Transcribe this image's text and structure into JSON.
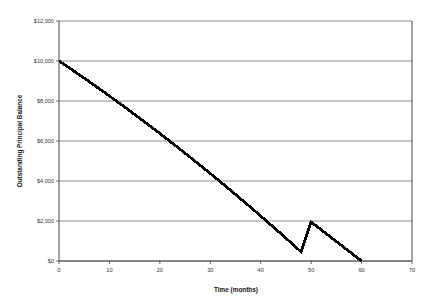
{
  "chart_data": {
    "type": "line",
    "title": "",
    "xlabel": "Time (months)",
    "ylabel": "Outstanding Principal Balance",
    "xlim": [
      0,
      70
    ],
    "ylim": [
      0,
      12000
    ],
    "grid": "horizontal",
    "legend": "none",
    "series": [
      {
        "name": "Outstanding Principal Balance",
        "color": "#000000",
        "x": [
          0,
          2,
          4,
          6,
          8,
          10,
          12,
          14,
          16,
          18,
          20,
          22,
          24,
          26,
          28,
          30,
          32,
          34,
          36,
          38,
          40,
          42,
          44,
          46,
          48,
          50,
          52,
          54,
          56,
          58,
          60
        ],
        "values": [
          10000,
          9660,
          9315,
          8965,
          8610,
          8250,
          7885,
          7515,
          7140,
          6760,
          6375,
          5985,
          5590,
          5190,
          4785,
          4375,
          3960,
          3540,
          3115,
          2685,
          2250,
          1810,
          1365,
          915,
          460,
          1950,
          1560,
          1170,
          780,
          390,
          0
        ]
      }
    ],
    "x_ticks": [
      {
        "value": 0,
        "label": "0"
      },
      {
        "value": 10,
        "label": "10"
      },
      {
        "value": 20,
        "label": "20"
      },
      {
        "value": 30,
        "label": "30"
      },
      {
        "value": 40,
        "label": "40"
      },
      {
        "value": 50,
        "label": "50"
      },
      {
        "value": 60,
        "label": "60"
      },
      {
        "value": 70,
        "label": "70"
      }
    ],
    "y_ticks": [
      {
        "value": 12000,
        "label": "$12,000"
      },
      {
        "value": 10000,
        "label": "$10,000"
      },
      {
        "value": 8000,
        "label": "$8,000"
      },
      {
        "value": 6000,
        "label": "$6,000"
      },
      {
        "value": 4000,
        "label": "$4,000"
      },
      {
        "value": 2000,
        "label": "$2,000"
      },
      {
        "value": 0,
        "label": "$0"
      }
    ],
    "colors": {
      "line": "#000000",
      "grid": "#808080",
      "axis": "#555555",
      "background": "#ffffff",
      "text": "#333333"
    }
  }
}
